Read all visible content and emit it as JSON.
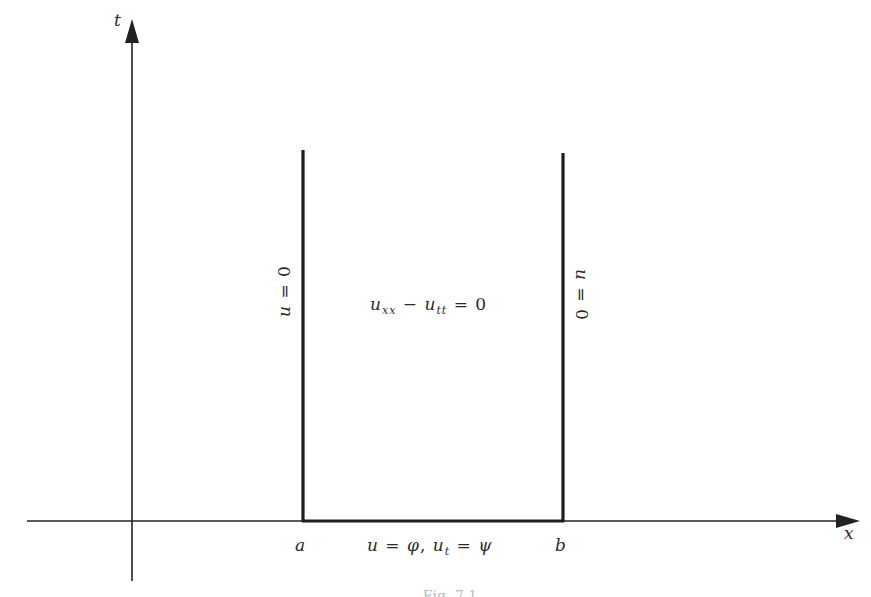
{
  "diagram": {
    "axes": {
      "x_label": "x",
      "t_label": "t"
    },
    "points": {
      "a": "a",
      "b": "b"
    },
    "boundary_conditions": {
      "left": {
        "u": "u",
        "eq": "=",
        "val": "0"
      },
      "right": {
        "u": "u",
        "eq": "=",
        "val": "0"
      },
      "bottom": {
        "u": "u",
        "eq1": "=",
        "phi": "φ",
        "comma": ",",
        "ut_base": "u",
        "ut_sub": "t",
        "eq2": "=",
        "psi": "ψ"
      }
    },
    "pde": {
      "u1": "u",
      "sub1": "xx",
      "minus": "−",
      "u2": "u",
      "sub2": "tt",
      "eq": "=",
      "rhs": "0"
    },
    "caption": "Fig. 7.1"
  },
  "colors": {
    "ink": "#1e1e1e",
    "background": "#ffffff"
  }
}
